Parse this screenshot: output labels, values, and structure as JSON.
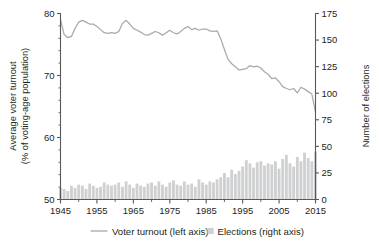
{
  "chart_data": {
    "type": "line",
    "title": "",
    "subtitle": "",
    "xlabel": "",
    "ylabel": "Average voter turnout\n(% of voting-age population)",
    "y2label": "Number of elections",
    "xlim": [
      1945,
      2015
    ],
    "ylim": [
      50,
      80
    ],
    "y2lim": [
      0,
      175
    ],
    "grid": false,
    "legend_position": "bottom",
    "x_ticks": [
      1945,
      1955,
      1965,
      1975,
      1985,
      1995,
      2005,
      2015
    ],
    "x_minor_tick_step": 5,
    "y_ticks": [
      50,
      60,
      70,
      80
    ],
    "y2_ticks": [
      0,
      25,
      50,
      75,
      100,
      125,
      150,
      175
    ],
    "series": [
      {
        "name": "Voter turnout (left axis)",
        "type": "line",
        "axis": "left",
        "color": "#a7a9ac",
        "x": [
          1945,
          1946,
          1947,
          1948,
          1949,
          1950,
          1951,
          1952,
          1953,
          1954,
          1955,
          1956,
          1957,
          1958,
          1959,
          1960,
          1961,
          1962,
          1963,
          1964,
          1965,
          1966,
          1967,
          1968,
          1969,
          1970,
          1971,
          1972,
          1973,
          1974,
          1975,
          1976,
          1977,
          1978,
          1979,
          1980,
          1981,
          1982,
          1983,
          1984,
          1985,
          1986,
          1987,
          1988,
          1989,
          1990,
          1991,
          1992,
          1993,
          1994,
          1995,
          1996,
          1997,
          1998,
          1999,
          2000,
          2001,
          2002,
          2003,
          2004,
          2005,
          2006,
          2007,
          2008,
          2009,
          2010,
          2011,
          2012,
          2013,
          2014,
          2015
        ],
        "values": [
          79.0,
          76.6,
          76.1,
          76.3,
          77.6,
          78.6,
          78.9,
          78.6,
          78.3,
          78.3,
          77.9,
          77.4,
          76.9,
          76.8,
          76.9,
          76.8,
          77.1,
          78.4,
          78.9,
          78.3,
          77.6,
          77.3,
          77.0,
          76.6,
          76.5,
          76.8,
          77.1,
          76.9,
          76.5,
          76.9,
          77.3,
          76.9,
          76.7,
          77.1,
          77.6,
          77.9,
          77.4,
          77.6,
          77.3,
          77.5,
          77.5,
          77.2,
          77.1,
          77.2,
          75.9,
          74.2,
          72.6,
          71.9,
          71.4,
          70.9,
          71.0,
          71.1,
          71.6,
          71.4,
          71.5,
          71.2,
          70.6,
          70.2,
          69.5,
          69.6,
          69.0,
          68.2,
          67.9,
          67.7,
          67.9,
          67.2,
          68.1,
          67.8,
          67.4,
          67.0,
          64.1
        ]
      },
      {
        "name": "Elections (right axis)",
        "type": "bar",
        "axis": "right",
        "color": "#cfd0d1",
        "x": [
          1945,
          1946,
          1947,
          1948,
          1949,
          1950,
          1951,
          1952,
          1953,
          1954,
          1955,
          1956,
          1957,
          1958,
          1959,
          1960,
          1961,
          1962,
          1963,
          1964,
          1965,
          1966,
          1967,
          1968,
          1969,
          1970,
          1971,
          1972,
          1973,
          1974,
          1975,
          1976,
          1977,
          1978,
          1979,
          1980,
          1981,
          1982,
          1983,
          1984,
          1985,
          1986,
          1987,
          1988,
          1989,
          1990,
          1991,
          1992,
          1993,
          1994,
          1995,
          1996,
          1997,
          1998,
          1999,
          2000,
          2001,
          2002,
          2003,
          2004,
          2005,
          2006,
          2007,
          2008,
          2009,
          2010,
          2011,
          2012,
          2013,
          2014,
          2015
        ],
        "values": [
          11,
          10,
          8,
          13,
          11,
          14,
          13,
          10,
          15,
          13,
          11,
          12,
          16,
          14,
          13,
          14,
          16,
          12,
          17,
          14,
          11,
          15,
          13,
          12,
          15,
          16,
          13,
          17,
          14,
          12,
          16,
          18,
          14,
          13,
          17,
          14,
          15,
          12,
          19,
          16,
          14,
          17,
          16,
          19,
          21,
          25,
          21,
          28,
          24,
          27,
          31,
          37,
          34,
          30,
          35,
          36,
          32,
          34,
          33,
          36,
          29,
          38,
          42,
          34,
          31,
          40,
          36,
          44,
          39,
          36,
          45
        ]
      }
    ]
  },
  "axes": {
    "left_title_line1": "Average voter turnout",
    "left_title_line2": "(% of voting-age population)",
    "right_title": "Number of elections",
    "x_tick_labels": [
      "1945",
      "1955",
      "1965",
      "1975",
      "1985",
      "1995",
      "2005",
      "2015"
    ],
    "y_tick_labels": [
      "50",
      "60",
      "70",
      "80"
    ],
    "y2_tick_labels": [
      "0",
      "25",
      "50",
      "75",
      "100",
      "125",
      "150",
      "175"
    ]
  },
  "legend": {
    "items": [
      {
        "label": "Voter turnout (left axis)",
        "marker": "line-swatch",
        "color": "#a7a9ac"
      },
      {
        "label": "Elections (right axis)",
        "marker": "square-swatch",
        "color": "#cfd0d1"
      }
    ]
  },
  "colors": {
    "line": "#a7a9ac",
    "bar": "#cfd0d1",
    "axis": "#58595b",
    "text": "#231f20",
    "background": "#ffffff"
  }
}
